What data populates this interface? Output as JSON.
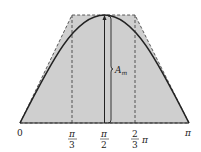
{
  "diagram": {
    "labels": {
      "origin": "0",
      "pi_over_3_num": "π",
      "pi_over_3_den": "3",
      "pi_over_2_num": "π",
      "pi_over_2_den": "2",
      "two_thirds_num": "2",
      "two_thirds_den": "3",
      "two_thirds_pi": "π",
      "pi": "π",
      "amplitude": "A",
      "amplitude_sub": "m"
    },
    "colors": {
      "fill": "#c8c8c8",
      "line": "#222222"
    }
  }
}
